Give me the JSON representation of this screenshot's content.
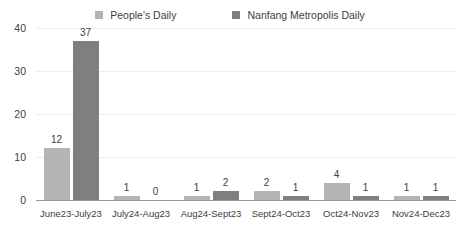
{
  "chart_data": {
    "type": "bar",
    "title": "",
    "subtitle": "",
    "xlabel": "",
    "ylabel": "",
    "ylim": [
      0,
      40
    ],
    "yticks": [
      0,
      10,
      20,
      30,
      40
    ],
    "grid": true,
    "legend_position": "top-center",
    "categories": [
      "June23-July23",
      "July24-Aug23",
      "Aug24-Sept23",
      "Sept24-Oct23",
      "Oct24-Nov23",
      "Nov24-Dec23"
    ],
    "series": [
      {
        "name": "People's Daily",
        "color": "#b4b4b4",
        "values": [
          12,
          1,
          1,
          2,
          4,
          1
        ]
      },
      {
        "name": "Nanfang Metropolis Daily",
        "color": "#7f7f7f",
        "values": [
          37,
          0,
          2,
          1,
          1,
          1
        ]
      }
    ]
  },
  "axis": {
    "grid_color": "#ededed",
    "axis_line_color": "#9a9a9a",
    "tick_label_color": "#404040"
  }
}
